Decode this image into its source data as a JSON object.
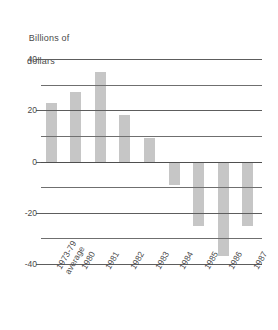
{
  "chart_data": {
    "type": "bar",
    "title": "",
    "axis_caption": {
      "line1": "Billions of",
      "line2": "dollars"
    },
    "xlabel": "",
    "ylabel": "Billions of dollars",
    "categories": [
      "1973-79\naverage",
      "1980",
      "1981",
      "1982",
      "1983",
      "1984",
      "1985",
      "1986",
      "1987"
    ],
    "category_lines": [
      [
        "1973-79",
        "average"
      ],
      [
        "1980",
        ""
      ],
      [
        "1981",
        ""
      ],
      [
        "1982",
        ""
      ],
      [
        "1983",
        ""
      ],
      [
        "1984",
        ""
      ],
      [
        "1985",
        ""
      ],
      [
        "1986",
        ""
      ],
      [
        "1987",
        ""
      ]
    ],
    "values": [
      23,
      27,
      35,
      18,
      9,
      -9,
      -25,
      -37,
      -25
    ],
    "ylim": [
      -40,
      40
    ],
    "yticks": [
      40,
      30,
      20,
      10,
      0,
      -10,
      -20,
      -30,
      -40
    ],
    "ytick_labels": [
      "40",
      "",
      "20",
      "",
      "0",
      "",
      "-20",
      "",
      "-40"
    ],
    "grid": true,
    "legend": "none",
    "bar_color": "#c6c6c6",
    "grid_color": "#6f6f6f"
  }
}
